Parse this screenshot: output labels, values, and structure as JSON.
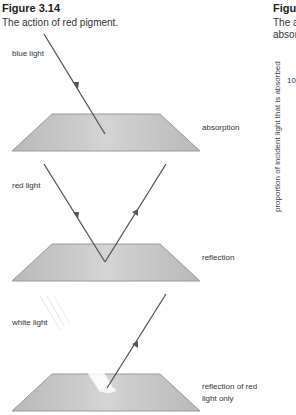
{
  "left_figure": {
    "number": "Figure 3.14",
    "caption": "The action of red pigment.",
    "panels": [
      {
        "incident_label": "blue light",
        "result_label": "absorption"
      },
      {
        "incident_label": "red light",
        "result_label": "reflection"
      },
      {
        "incident_label": "white light",
        "result_label_line1": "reflection of red",
        "result_label_line2": "light only"
      }
    ]
  },
  "right_figure": {
    "number_partial": "Figur",
    "caption_line1_partial": "The a",
    "caption_line2_partial": "absor",
    "y_axis_label": "proportion of incident light that is absorbed",
    "y_tick_partial": "10"
  },
  "colors": {
    "surface_fill": "#c4c4c4",
    "surface_edge": "#9a9a9a",
    "ray": "#555555",
    "white_beam": "#f2f2f2"
  }
}
